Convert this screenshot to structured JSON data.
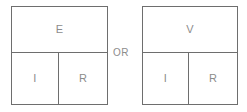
{
  "figure": {
    "type": "formula-chart",
    "background_color": "#ffffff",
    "line_color": "#6e6e6e",
    "text_color": "#8c8c8c",
    "width": 247,
    "height": 112
  },
  "connector": {
    "label": "OR"
  },
  "charts": [
    {
      "id": "ohm-chart-left",
      "numerator": {
        "symbol": "E",
        "meaning": "electromotive force"
      },
      "denominators": [
        {
          "symbol": "I",
          "meaning": "current"
        },
        {
          "symbol": "R",
          "meaning": "resistance"
        }
      ]
    },
    {
      "id": "ohm-chart-right",
      "numerator": {
        "symbol": "V",
        "meaning": "voltage"
      },
      "denominators": [
        {
          "symbol": "I",
          "meaning": "current"
        },
        {
          "symbol": "R",
          "meaning": "resistance"
        }
      ]
    }
  ]
}
